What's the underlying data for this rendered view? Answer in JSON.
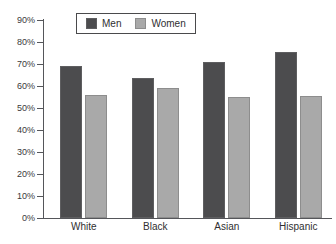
{
  "chart_data": {
    "type": "bar",
    "title": "",
    "subtitle": "",
    "xlabel": "",
    "ylabel": "",
    "categories": [
      "White",
      "Black",
      "Asian",
      "Hispanic"
    ],
    "series": [
      {
        "name": "Men",
        "color": "#4c4c4e",
        "values": [
          69,
          63.5,
          71,
          75.5
        ]
      },
      {
        "name": "Women",
        "color": "#a9a9a9",
        "values": [
          56,
          59,
          55,
          55.5
        ]
      }
    ],
    "ylim": [
      0,
      90
    ],
    "ytick_values": [
      0,
      10,
      20,
      30,
      40,
      50,
      60,
      70,
      80,
      90
    ],
    "ytick_labels": [
      "0%",
      "10%",
      "20%",
      "30%",
      "40%",
      "50%",
      "60%",
      "70%",
      "80%",
      "90%"
    ],
    "grid": false,
    "legend_position": "top-center",
    "legend_entries": [
      "Men",
      "Women"
    ]
  }
}
